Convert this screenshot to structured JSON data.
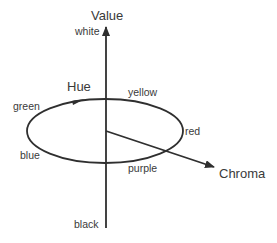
{
  "diagram": {
    "type": "munsell-color-space",
    "axes": {
      "value": {
        "label": "Value",
        "top": "white",
        "bottom": "black"
      },
      "hue": {
        "label": "Hue"
      },
      "chroma": {
        "label": "Chroma"
      }
    },
    "hue_labels": {
      "green": "green",
      "yellow": "yellow",
      "red": "red",
      "purple": "purple",
      "blue": "blue"
    },
    "line_color": "#2f2f2f",
    "text_color": "#3a3a3a"
  }
}
